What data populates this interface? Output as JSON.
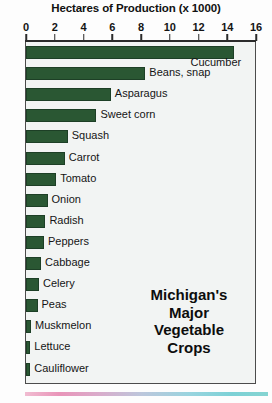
{
  "chart_data": {
    "type": "bar",
    "orientation": "horizontal",
    "title": "Hectares of Production (x 1000)",
    "xlabel": "",
    "ylabel": "",
    "xlim": [
      0,
      16
    ],
    "xticks": [
      0,
      2,
      4,
      6,
      8,
      10,
      12,
      14,
      16
    ],
    "grid": false,
    "legend": null,
    "bar_color": "#2a5733",
    "categories": [
      "Cucumber",
      "Beans, snap",
      "Asparagus",
      "Sweet corn",
      "Squash",
      "Carrot",
      "Tomato",
      "Onion",
      "Radish",
      "Peppers",
      "Cabbage",
      "Celery",
      "Peas",
      "Muskmelon",
      "Lettuce",
      "Cauliflower"
    ],
    "values": [
      14.5,
      8.3,
      5.9,
      4.9,
      2.9,
      2.7,
      2.1,
      1.5,
      1.35,
      1.25,
      1.05,
      0.9,
      0.8,
      0.35,
      0.3,
      0.3
    ],
    "annotations": [
      "Michigan's",
      "Major",
      "Vegetable",
      "Crops"
    ]
  },
  "caption": {
    "line1": "Michigan's",
    "line2": "Major",
    "line3": "Vegetable",
    "line4": "Crops"
  }
}
